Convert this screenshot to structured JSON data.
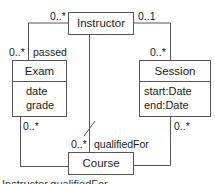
{
  "diagram": {
    "type": "uml-class-diagram",
    "classes": {
      "instructor": {
        "name": "Instructor",
        "attributes": []
      },
      "exam": {
        "name": "Exam",
        "attributes": [
          "date",
          "grade"
        ]
      },
      "session": {
        "name": "Session",
        "attributes": [
          "start:Date",
          "end:Date"
        ]
      },
      "course": {
        "name": "Course",
        "attributes": []
      }
    },
    "associations": [
      {
        "from": "Instructor",
        "to": "Exam",
        "from_mult": "0..*",
        "to_mult": "0..*",
        "role": "passed"
      },
      {
        "from": "Instructor",
        "to": "Session",
        "from_mult": "0..1",
        "to_mult": "0..*"
      },
      {
        "from": "Instructor",
        "to": "Course",
        "to_mult": "0..*",
        "role": "qualifiedFor",
        "derived": true
      },
      {
        "from": "Exam",
        "to": "Course",
        "from_mult": "0..*"
      },
      {
        "from": "Session",
        "to": "Course",
        "from_mult": "0..*"
      }
    ],
    "labels": {
      "inst_exam_mult": "0..*",
      "exam_mult_top": "0..*",
      "passed_role": "passed",
      "inst_session_mult": "0..1",
      "session_mult_top": "0..*",
      "exam_course_mult": "0..*",
      "session_course_mult": "0..*",
      "course_qualified_mult": "0..*",
      "qualified_role": "qualifiedFor"
    },
    "caption": "Instructor.qualifiedFor"
  }
}
